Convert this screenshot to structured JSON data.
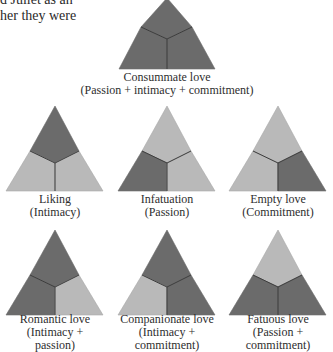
{
  "intro": {
    "lines": [
      "d Juliet as an",
      "her they were"
    ]
  },
  "colors": {
    "present": "#6b6b6b",
    "absent": "#b9b9b9",
    "divider": "#3c3c3c",
    "text": "#2e2e2e"
  },
  "legend_regions": {
    "top": "Intimacy",
    "left": "Passion",
    "right": "Commitment"
  },
  "love_types": [
    {
      "name": "Consummate love",
      "components": "(Passion + intimacy + commitment)",
      "caption_lines": [
        "Consummate love",
        "(Passion + intimacy + commitment)"
      ],
      "intimacy": true,
      "passion": true,
      "commitment": true
    },
    {
      "name": "Liking",
      "components": "(Intimacy)",
      "caption_lines": [
        "Liking",
        "(Intimacy)"
      ],
      "intimacy": true,
      "passion": false,
      "commitment": false
    },
    {
      "name": "Infatuation",
      "components": "(Passion)",
      "caption_lines": [
        "Infatuation",
        "(Passion)"
      ],
      "intimacy": false,
      "passion": true,
      "commitment": false
    },
    {
      "name": "Empty love",
      "components": "(Commitment)",
      "caption_lines": [
        "Empty love",
        "(Commitment)"
      ],
      "intimacy": false,
      "passion": false,
      "commitment": true
    },
    {
      "name": "Romantic love",
      "components": "(Intimacy + passion)",
      "caption_lines": [
        "Romantic love",
        "(Intimacy +",
        "passion)"
      ],
      "intimacy": true,
      "passion": true,
      "commitment": false
    },
    {
      "name": "Companionate love",
      "components": "(Intimacy + commitment)",
      "caption_lines": [
        "Companionate love",
        "(Intimacy +",
        "commitment)"
      ],
      "intimacy": true,
      "passion": false,
      "commitment": true
    },
    {
      "name": "Fatuous love",
      "components": "(Passion + commitment)",
      "caption_lines": [
        "Fatuous love",
        "(Passion +",
        "commitment)"
      ],
      "intimacy": false,
      "passion": true,
      "commitment": true
    }
  ]
}
